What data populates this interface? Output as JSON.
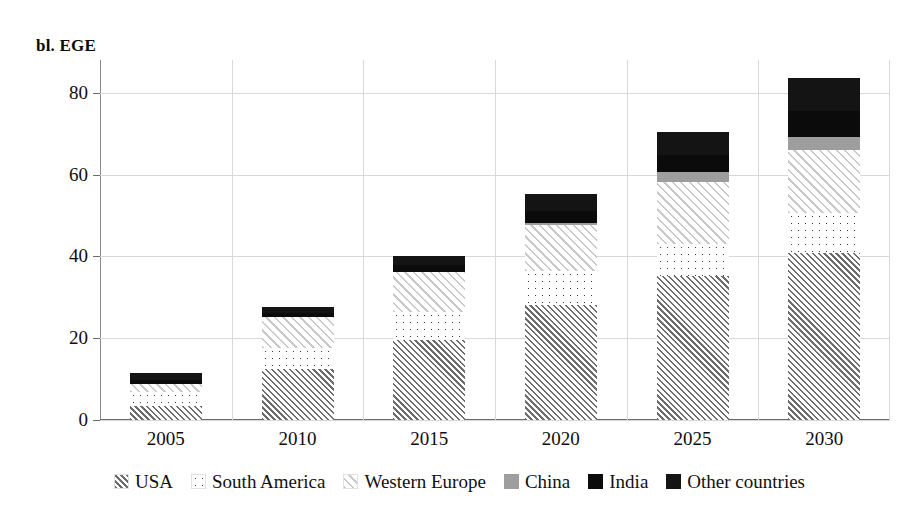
{
  "axis_title": "bl. EGE",
  "legend": {
    "items": [
      {
        "label": "USA",
        "key": "usa",
        "swatch": "usa-hatch-swatch"
      },
      {
        "label": "South America",
        "key": "south_america",
        "swatch": "south-america-dots-swatch"
      },
      {
        "label": "Western Europe",
        "key": "western_europe",
        "swatch": "western-europe-hatch-swatch"
      },
      {
        "label": "China",
        "key": "china",
        "swatch": "china-gray-swatch"
      },
      {
        "label": "India",
        "key": "india",
        "swatch": "india-black-swatch"
      },
      {
        "label": "Other countries",
        "key": "other_countries",
        "swatch": "other-countries-black-swatch"
      }
    ]
  },
  "chart_data": {
    "type": "bar",
    "subtype": "stacked-vertical",
    "title": "",
    "subtitle": "",
    "xlabel": "",
    "ylabel": "bl. EGE",
    "ylim": [
      0,
      88
    ],
    "yticks": [
      0,
      20,
      40,
      60,
      80
    ],
    "ytick_labels": [
      "0",
      "20",
      "40",
      "60",
      "80"
    ],
    "grid": "horizontal-and-vertical",
    "legend_position": "bottom-center",
    "categories": [
      "2005",
      "2010",
      "2015",
      "2020",
      "2025",
      "2030"
    ],
    "series": [
      {
        "name": "USA",
        "color": "#6d6d6d",
        "pattern": "dense-diagonal-hatch",
        "values": [
          3.4,
          12.5,
          19.6,
          28.0,
          35.3,
          40.8
        ]
      },
      {
        "name": "South America",
        "color": "#3d3d3d",
        "pattern": "dots",
        "values": [
          3.4,
          5.0,
          6.8,
          8.4,
          7.8,
          9.7
        ]
      },
      {
        "name": "Western Europe",
        "color": "#c9c9c9",
        "pattern": "light-diagonal-hatch",
        "values": [
          2.1,
          7.6,
          9.9,
          11.2,
          15.2,
          15.4
        ]
      },
      {
        "name": "China",
        "color": "#9e9e9e",
        "pattern": "solid-gray",
        "values": [
          0.0,
          0.0,
          0.0,
          0.6,
          2.3,
          3.4
        ]
      },
      {
        "name": "India",
        "color": "#0b0b0b",
        "pattern": "solid-black",
        "values": [
          1.0,
          1.1,
          1.5,
          2.8,
          4.2,
          6.2
        ]
      },
      {
        "name": "Other countries",
        "color": "#141414",
        "pattern": "solid-black",
        "values": [
          1.6,
          1.5,
          2.2,
          4.2,
          5.5,
          8.0
        ]
      }
    ],
    "totals": [
      11.5,
      27.7,
      40.0,
      55.2,
      70.3,
      83.5
    ]
  }
}
